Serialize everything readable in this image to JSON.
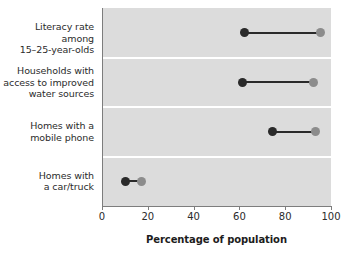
{
  "chart_data": {
    "type": "dumbbell",
    "title": "",
    "xlabel": "Percentage of population",
    "ylabel": "",
    "xlim": [
      0,
      100
    ],
    "xticks": [
      0,
      20,
      40,
      60,
      80,
      100
    ],
    "xtick_labels": [
      "0",
      "20",
      "40",
      "60",
      "80",
      "100"
    ],
    "grid": false,
    "legend": "none",
    "panel_background": "#dcdcdc",
    "separator_color": "#ffffff",
    "start_color": "#2a2a2a",
    "end_color": "#8c8c8c",
    "categories": [
      "Literacy rate among 15–25-year-olds",
      "Households with access to improved water sources",
      "Homes with a mobile phone",
      "Homes with a car/truck"
    ],
    "category_label_lines": [
      [
        "Literacy rate among",
        "15–25-year-olds"
      ],
      [
        "Households with",
        "access to improved",
        "water sources"
      ],
      [
        "Homes with a",
        "mobile phone"
      ],
      [
        "Homes with",
        "a car/truck"
      ]
    ],
    "series": [
      {
        "name": "start",
        "values": [
          62,
          61,
          74,
          10
        ]
      },
      {
        "name": "end",
        "values": [
          95,
          92,
          93,
          17
        ]
      }
    ]
  }
}
